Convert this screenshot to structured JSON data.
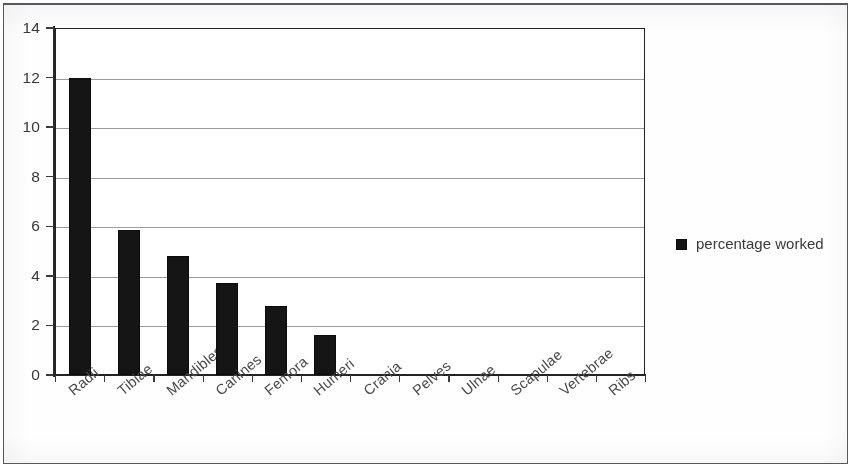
{
  "chart_data": {
    "type": "bar",
    "title": "",
    "subtitle": "",
    "xlabel": "",
    "ylabel": "",
    "categories": [
      "Radii",
      "Tibiae",
      "Mandibles",
      "Canines",
      "Femora",
      "Humeri",
      "Crania",
      "Pelves",
      "Ulnae",
      "Scapulae",
      "Vertebrae",
      "Ribs"
    ],
    "values": [
      12.0,
      5.85,
      4.8,
      3.7,
      2.8,
      1.6,
      0,
      0,
      0,
      0,
      0,
      0
    ],
    "series": [
      {
        "name": "percentage worked",
        "values": [
          12.0,
          5.85,
          4.8,
          3.7,
          2.8,
          1.6,
          0,
          0,
          0,
          0,
          0,
          0
        ]
      }
    ],
    "ylim": [
      0,
      14
    ],
    "yticks": [
      0,
      2,
      4,
      6,
      8,
      10,
      12,
      14
    ],
    "ytick_labels": [
      "0",
      "2",
      "4",
      "6",
      "8",
      "10",
      "12",
      "14"
    ],
    "grid": true,
    "grid_axis": "y",
    "legend": {
      "position": "right",
      "entries": [
        {
          "label": "percentage worked",
          "color": "#141414",
          "marker": "square"
        }
      ]
    },
    "xtick_rotation": -40,
    "bar_color": "#141414",
    "plot_background": "#ffffff",
    "axis_color": "#232323",
    "grid_color": "#9b9b9b"
  }
}
